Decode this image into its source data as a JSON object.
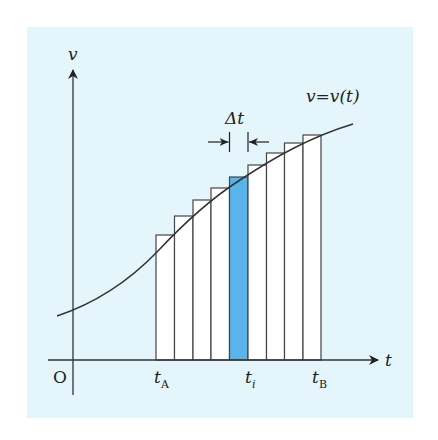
{
  "figure": {
    "background_color": "#e4f6fb",
    "highlight_color": "#5ab4ea",
    "line_color": "#333333",
    "axes": {
      "x_label": "t",
      "y_label": "v",
      "origin_label": "O"
    },
    "curve_label": "v=v(t)",
    "curve_label_parts": {
      "lhs": "v",
      "eq": "=",
      "rhs": "v(t)"
    },
    "delta_label": "Δt",
    "tick_labels": [
      {
        "name": "t",
        "sub": "A"
      },
      {
        "name": "t",
        "sub": "i"
      },
      {
        "name": "t",
        "sub": "B"
      }
    ],
    "bars": {
      "count": 9,
      "highlighted_index": 4
    }
  }
}
